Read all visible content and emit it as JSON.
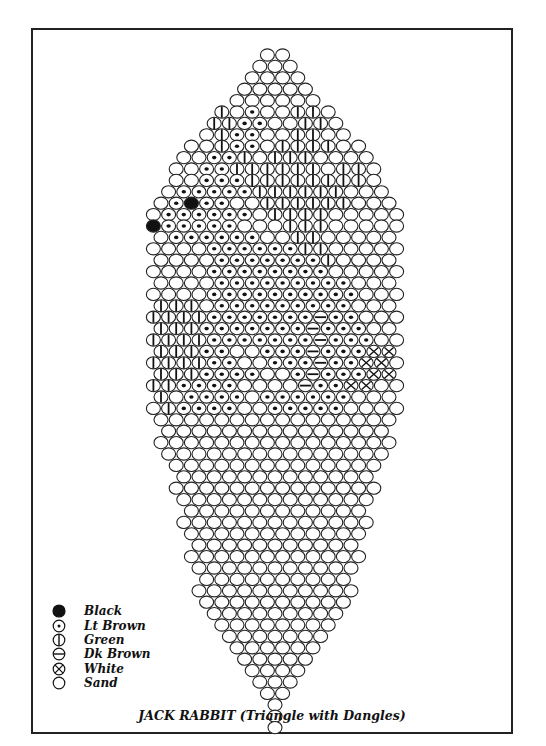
{
  "title": "JACK RABBIT (Triangle with Dangles)",
  "legend": [
    {
      "code": "K",
      "symbol": "filled-circle",
      "label": "Black"
    },
    {
      "code": "L",
      "symbol": "dotted-circle",
      "label": "Lt Brown"
    },
    {
      "code": "G",
      "symbol": "vertical-bar-circle",
      "label": "Green"
    },
    {
      "code": "D",
      "symbol": "horizontal-bar-circle",
      "label": "Dk Brown"
    },
    {
      "code": "W",
      "symbol": "x-circle",
      "label": "White"
    },
    {
      "code": "S",
      "symbol": "open-circle",
      "label": "Sand"
    }
  ],
  "pattern": {
    "center_x": 275,
    "top_y": 55,
    "bead_w": 15.2,
    "row_h": 11.4,
    "rows": [
      "SS",
      "SSS",
      "SSSS",
      "SSSSS",
      "SSSSSS",
      "GSLSSGGS",
      "GGLLSSGGS",
      "SGLLSSGGSS",
      "SSGLLSGGGGSS",
      "SSLLGSGGGSSSS",
      "SSLLGGGGGGSGGS",
      "SSLLLGGGGGGGGS",
      "SLLLLLGGGGGGSSS",
      "SLKLLSSGGGGGGSSS",
      "SLLLLLLSGGGGSSSSS",
      "KLLLLLSSSGGGSSSSS",
      "SLLLLLLSSGGSSSSS",
      "SSSSLLLLLLGGSSSSS",
      "SSSSLLLLLLLGSSSS",
      "SSSSLLLLLLLLSSSSS",
      "SSSSLLLLLLLLLSSS",
      "SSSSLLLLLLLLLLSSS",
      "GGGSLLLLLLLLLSSS",
      "GGGGLLLLLLLDLLSSS",
      "GGGLLLLLLLDLLLSS",
      "GGGGLLLLLLLDLLLSS",
      "GGGLLSSLLLDLLLWW",
      "GGGGLLSSLLLDLLWWS",
      "GGGLLLLSSLDLLLWW",
      "GGLLLLSSSSDLLWWSS",
      "GSLLLLSLLLLLLSSS",
      "SGLLLLSSLLLLLSSSS",
      "SSSSSSSSSSSSSSSS",
      "SSSSSSSSSSSSSSS",
      "SSSSSSSSSSSSSSSS",
      "SSSSSSSSSSSSSSS",
      "SSSSSSSSSSSSSS",
      "SSSSSSSSSSSSS",
      "SSSSSSSSSSSSSS",
      "SSSSSSSSSSSSS",
      "SSSSSSSSSSSS",
      "SSSSSSSSSSSSS",
      "SSSSSSSSSSSS",
      "SSSSSSSSSSS",
      "SSSSSSSSSSSS",
      "SSSSSSSSSSS",
      "SSSSSSSSSS",
      "SSSSSSSSSSS",
      "SSSSSSSSSS",
      "SSSSSSSSS",
      "SSSSSSSS",
      "SSSSSSS",
      "SSSSSS",
      "SSSSS",
      "SSSS",
      "SSS",
      "SS",
      "S",
      "S",
      "S"
    ]
  }
}
